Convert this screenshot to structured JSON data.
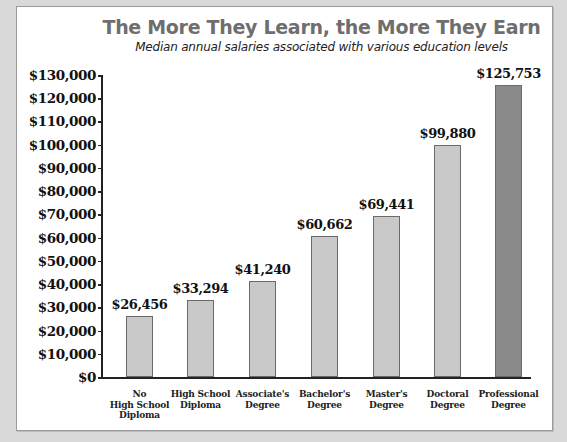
{
  "chart_data": {
    "type": "bar",
    "title": "The More They Learn, the More They Earn",
    "subtitle": "Median annual salaries associated with various education levels",
    "xlabel": "",
    "ylabel": "",
    "ylim": [
      0,
      130000
    ],
    "grid": false,
    "legend": null,
    "yticks": [
      0,
      10000,
      20000,
      30000,
      40000,
      50000,
      60000,
      70000,
      80000,
      90000,
      100000,
      110000,
      120000,
      130000
    ],
    "ytick_labels": [
      "$0",
      "$10,000",
      "$20,000",
      "$30,000",
      "$40,000",
      "$50,000",
      "$60,000",
      "$70,000",
      "$80,000",
      "$90,000",
      "$100,000",
      "$110,000",
      "$120,000",
      "$130,000"
    ],
    "categories": [
      "No\nHigh School\nDiploma",
      "High School\nDiploma",
      "Associate's\nDegree",
      "Bachelor's\nDegree",
      "Master's\nDegree",
      "Doctoral\nDegree",
      "Professional\nDegree"
    ],
    "values": [
      26456,
      33294,
      41240,
      60662,
      69441,
      99880,
      125753
    ],
    "value_labels": [
      "$26,456",
      "$33,294",
      "$41,240",
      "$60,662",
      "$69,441",
      "$99,880",
      "$125,753"
    ],
    "colors": [
      "#c9c9c9",
      "#c9c9c9",
      "#c9c9c9",
      "#c9c9c9",
      "#c9c9c9",
      "#c9c9c9",
      "#8a8a8a"
    ]
  },
  "style": {
    "background": "#d9d9d9",
    "panel": "#ffffff",
    "title_color": "#6e6e6e",
    "bar_color": "#c9c9c9",
    "highlight_bar_color": "#8a8a8a"
  }
}
